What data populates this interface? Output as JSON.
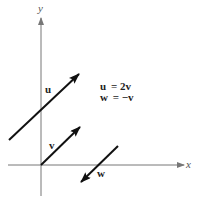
{
  "diagram": {
    "axes": {
      "x_label": "x",
      "y_label": "y"
    },
    "vectors": [
      {
        "name": "u",
        "label": "u"
      },
      {
        "name": "v",
        "label": "v"
      },
      {
        "name": "w",
        "label": "w"
      }
    ],
    "equations": [
      {
        "lhs": "u",
        "rhs": "= 2v"
      },
      {
        "lhs": "w",
        "rhs": "= −v"
      }
    ],
    "colors": {
      "axis": "#777777",
      "vector": "#111111"
    }
  }
}
